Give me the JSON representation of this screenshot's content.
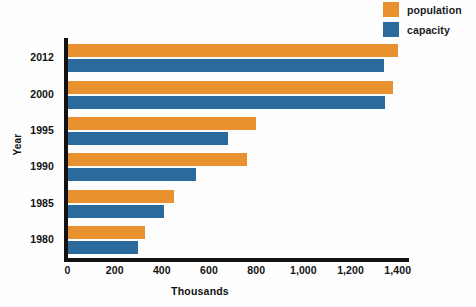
{
  "chart_data": {
    "type": "bar",
    "orientation": "horizontal",
    "title": "",
    "subtitle": "",
    "xlabel": "Thousands",
    "ylabel": "Year",
    "categories": [
      "2012",
      "2000",
      "1995",
      "1990",
      "1985",
      "1980"
    ],
    "series": [
      {
        "name": "population",
        "color": "#e8912e",
        "values": [
          1400,
          1380,
          800,
          760,
          450,
          330
        ]
      },
      {
        "name": "capacity",
        "color": "#2c6a9c",
        "values": [
          1340,
          1345,
          680,
          545,
          410,
          300
        ]
      }
    ],
    "xlim": [
      0,
      1450
    ],
    "xticks": [
      0,
      200,
      400,
      600,
      800,
      1000,
      1200,
      1400
    ],
    "xticklabels": [
      "0",
      "200",
      "400",
      "600",
      "800",
      "1,000",
      "1,200",
      "1,400"
    ],
    "grid": false,
    "legend_position": "top-right"
  },
  "legend": {
    "items": [
      {
        "label": "population",
        "color": "#e8912e",
        "swatch_name": "legend-swatch-population"
      },
      {
        "label": "capacity",
        "color": "#2c6a9c",
        "swatch_name": "legend-swatch-capacity"
      }
    ]
  },
  "axes": {
    "x_title": "Thousands",
    "y_title": "Year"
  }
}
